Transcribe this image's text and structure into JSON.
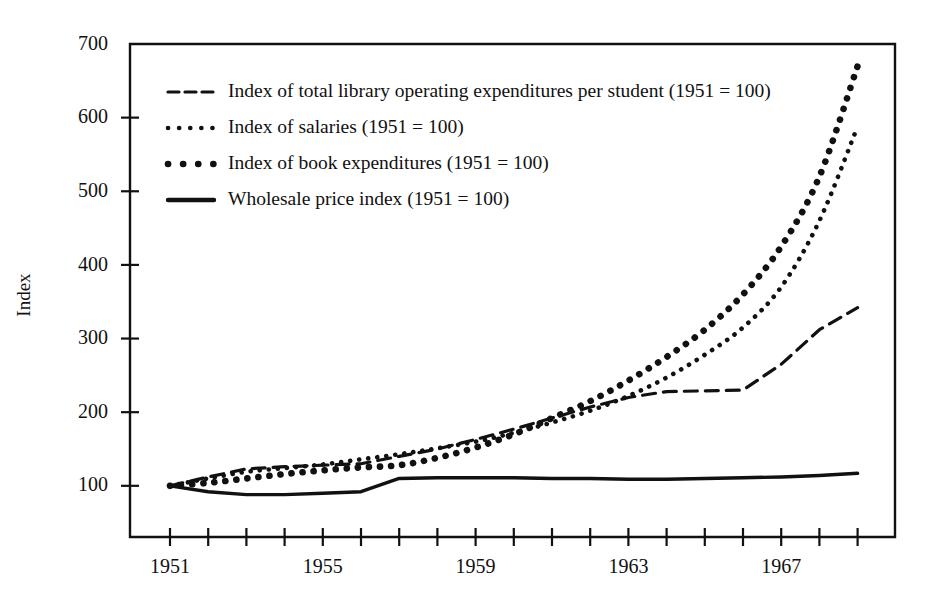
{
  "chart_data": {
    "type": "line",
    "title": "",
    "xlabel": "",
    "ylabel": "Index",
    "xlim": [
      1951,
      1969
    ],
    "ylim": [
      30,
      700
    ],
    "grid": false,
    "legend_position": "upper-left inside plot",
    "y_ticks": [
      100,
      200,
      300,
      400,
      500,
      600,
      700
    ],
    "x_ticks": [
      1951,
      1952,
      1953,
      1954,
      1955,
      1956,
      1957,
      1958,
      1959,
      1960,
      1961,
      1962,
      1963,
      1964,
      1965,
      1966,
      1967,
      1968,
      1969
    ],
    "x_tick_labels": [
      "1951",
      "",
      "",
      "",
      "1955",
      "",
      "",
      "",
      "1959",
      "",
      "",
      "",
      "1963",
      "",
      "",
      "",
      "1967",
      "",
      ""
    ],
    "x": [
      1951,
      1952,
      1953,
      1954,
      1955,
      1956,
      1957,
      1958,
      1959,
      1960,
      1961,
      1962,
      1963,
      1964,
      1965,
      1966,
      1967,
      1968,
      1969
    ],
    "series": [
      {
        "name": "Index of total library operating expenditures per student (1951 = 100)",
        "style": "dashed",
        "values": [
          100,
          112,
          123,
          126,
          128,
          130,
          140,
          150,
          163,
          177,
          192,
          207,
          220,
          228,
          229,
          230,
          265,
          312,
          342
        ]
      },
      {
        "name": "Index of salaries (1951 = 100)",
        "style": "fine-dotted",
        "values": [
          100,
          110,
          119,
          124,
          129,
          136,
          143,
          151,
          160,
          172,
          186,
          202,
          222,
          247,
          278,
          315,
          370,
          460,
          588
        ]
      },
      {
        "name": "Index of book expenditures (1951 = 100)",
        "style": "bold-dotted",
        "values": [
          100,
          104,
          110,
          116,
          121,
          125,
          128,
          138,
          152,
          170,
          192,
          215,
          243,
          275,
          312,
          360,
          425,
          520,
          670
        ]
      },
      {
        "name": "Wholesale price index (1951 = 100)",
        "style": "solid",
        "values": [
          100,
          92,
          88,
          88,
          90,
          92,
          110,
          111,
          111,
          111,
          110,
          110,
          109,
          109,
          110,
          111,
          112,
          114,
          117
        ]
      }
    ]
  },
  "legend": {
    "entries": [
      {
        "label": "Index of total library operating expenditures per student (1951 = 100)",
        "style": "dashed"
      },
      {
        "label": "Index of salaries (1951 = 100)",
        "style": "fine-dotted"
      },
      {
        "label": "Index of book expenditures (1951 = 100)",
        "style": "bold-dotted"
      },
      {
        "label": "Wholesale price index (1951 = 100)",
        "style": "solid"
      }
    ]
  },
  "colors": {
    "ink": "#111111",
    "background": "#ffffff"
  }
}
